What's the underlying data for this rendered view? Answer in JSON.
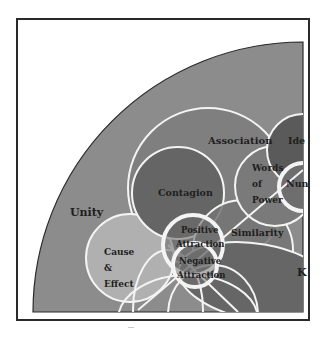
{
  "diagram": {
    "type": "overlapping-circles (Venn-like) quarter diagram",
    "background_color": "#ffffff",
    "frame_color": "#2a2a2a",
    "outer_region": {
      "label": "Unity",
      "color": "#8c8c8c"
    },
    "regions": [
      {
        "id": "association",
        "label": "Association",
        "color": "#7f7f7f"
      },
      {
        "id": "contagion",
        "label": "Contagion",
        "color": "#656565"
      },
      {
        "id": "words_of_power",
        "label_lines": [
          "Words",
          "of",
          "Power"
        ],
        "color": "#7a7a7a"
      },
      {
        "id": "ideas",
        "label": "Ide",
        "color": "#5a5a5a"
      },
      {
        "id": "numbers",
        "label": "Nun",
        "color": "#6e6e6e"
      },
      {
        "id": "similarity",
        "label": "Similarity",
        "color": "#7c7c7c"
      },
      {
        "id": "cause_effect",
        "label_lines": [
          "Cause",
          "&",
          "Effect"
        ],
        "color": "#b0b0b0"
      },
      {
        "id": "positive_attraction",
        "label_lines": [
          "Positive",
          "Attraction"
        ],
        "color": "#6c6c6c"
      },
      {
        "id": "negative_attraction",
        "label_lines": [
          "Negative",
          "Attraction"
        ],
        "color": "#707070"
      },
      {
        "id": "k_region",
        "label": "K",
        "color": "#666666"
      }
    ],
    "line_color": "#f4f4f4"
  }
}
